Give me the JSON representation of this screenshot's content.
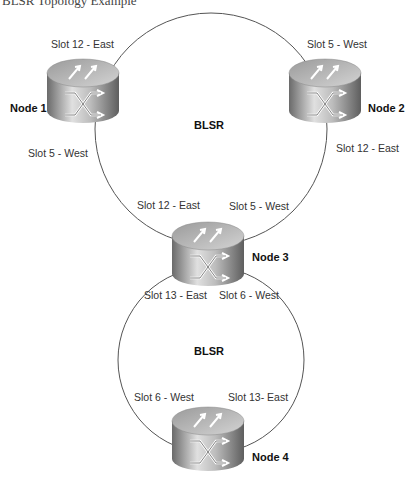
{
  "caption": "BLSR Topology Example",
  "rings": [
    {
      "name": "BLSR",
      "id": "ring-1"
    },
    {
      "name": "BLSR",
      "id": "ring-2"
    }
  ],
  "nodes": [
    {
      "label": "Node 1",
      "slots": [
        "Slot 12 - East",
        "Slot 5 - West"
      ]
    },
    {
      "label": "Node 2",
      "slots": [
        "Slot 5 - West",
        "Slot 12 - East"
      ]
    },
    {
      "label": "Node 3",
      "slots": [
        "Slot 12 - East",
        "Slot 5 - West",
        "Slot 13 - East",
        "Slot 6 - West"
      ]
    },
    {
      "label": "Node 4",
      "slots": [
        "Slot 6 - West",
        "Slot 13- East"
      ]
    }
  ],
  "colors": {
    "ring_line": "#555555",
    "node_body_dark": "#6e6e6e",
    "node_body_light": "#d8d8d8",
    "node_top": "#bdbdbd"
  }
}
